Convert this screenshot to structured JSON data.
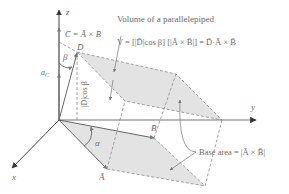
{
  "title": "Volume of a parallelepiped",
  "formula": "V = [|D̄|cos β] [|Ā × B̄|] = D̄·Ā × B̄",
  "formula_parts": {
    "lhs": "V = [|",
    "d": "D̄",
    "cos": "|cos",
    "beta": " β] [|",
    "axb": "Ā × B̄",
    "rhs": "|] = D̄·Ā × B̄"
  },
  "cross_product_label": "C̄ = Ā × B̄",
  "unit_vector_label": "a",
  "unit_vector_sub": "C",
  "height_label": "|D̄|cos β",
  "base_area_label": "Base area = |Ā × B̄|",
  "angle_alpha": "α",
  "angle_beta": "β",
  "vectors": {
    "a": "Ā",
    "b": "B̄",
    "d": "D̄"
  },
  "axes": {
    "x": "x",
    "y": "y",
    "z": "z"
  },
  "colors": {
    "axis": "#555555",
    "shade": "#e3e3e3",
    "dash": "#8a8a8a",
    "text": "#6b6b6b"
  }
}
